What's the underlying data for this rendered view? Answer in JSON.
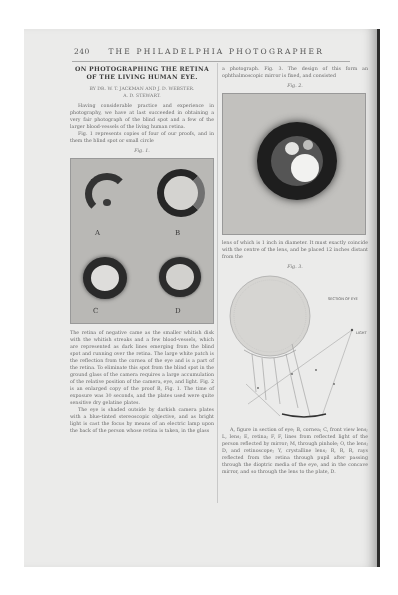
{
  "page": {
    "page_number": "240",
    "running_head": "THE PHILADELPHIA PHOTOGRAPHER"
  },
  "article": {
    "title_line1": "ON PHOTOGRAPHING THE RETINA",
    "title_line2": "OF THE LIVING HUMAN EYE.",
    "byline_line1": "BY DR. W. T. JACKMAN AND J. D. WEBSTER.",
    "byline_line2": "A. D. STEWART."
  },
  "left_column": {
    "paragraph_1": "Having considerable practice and experience in photography, we have at last succeeded in obtaining a very fair photograph of the blind spot and a few of the larger blood-vessels of the living human retina.",
    "paragraph_2": "Fig. 1 represents copies of four of our proofs, and in them the blind spot or small circle",
    "fig1_caption": "Fig. 1.",
    "fig1_labels": [
      "A",
      "B",
      "C",
      "D"
    ],
    "paragraph_3": "The retina of negative came as the smaller whitish disk with the whitish streaks and a few blood-vessels, which are represented as dark lines emerging from the blind spot and running over the retina. The large white patch is the reflection from the cornea of the eye and is a part of the retina. To eliminate this spot from the blind spot in the ground glass of the camera requires a large accumulation of the relative position of the camera, eye, and light. Fig. 2 is an enlarged copy of the proof B, Fig. 1. The time of exposure was 30 seconds, and the plates used were quite sensitive dry gelatine plates.",
    "paragraph_4": "The eye is shaded outside by darkish camera plates with a blue-tinted stereoscopic objective, and as bright light is cast the focus by means of an electric lamp upon the back of the person whose retina is taken, in the glass"
  },
  "right_column": {
    "paragraph_1": "a photograph. Fig. 3. The design of this form an ophthalmoscopic mirror is fixed, and consisted",
    "fig2_caption": "Fig. 2.",
    "paragraph_2": "lens of which is 1 inch in diameter. It must exactly coincide with the centre of the lens, and be placed 12 inches distant from the",
    "fig3_caption": "Fig. 3.",
    "fig3_label_section": "SECTION OF EYE",
    "fig3_label_light": "LIGHT",
    "paragraph_3": "A, figure in section of eye; B, cornea; C, front view lens; L, lens; E, retina; F, F, lines from reflected light of the person reflected by mirror; M, through pinhole; O, the lens; D, and retinoscope; Y, crystalline lens; R, R, R, rays reflected from the retina through pupil after passing through the dioptric media of the eye, and in the concave mirror, and so through the lens to the plate, D."
  },
  "colors": {
    "page_background": "#ebebea",
    "text": "#6a6a6a",
    "plate_gray": "#b9b8b5",
    "binding_edge": "#2c2c2c"
  }
}
